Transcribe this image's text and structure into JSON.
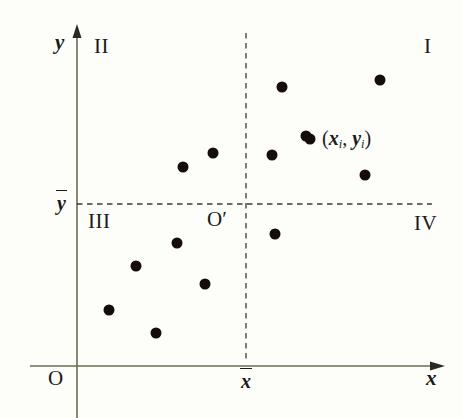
{
  "figure": {
    "background_color": "#fdfdfa",
    "axis_color": "#6b6b52",
    "dash_color": "#3a3a3a",
    "point_color": "#140d0a",
    "text_color": "#1a1a1a"
  },
  "axes": {
    "x_label": "x",
    "y_label": "y",
    "origin_label": "O",
    "x_axis_y": 366,
    "y_axis_x": 77,
    "x_axis_end": 443,
    "y_axis_top": 28
  },
  "means": {
    "x_mean_label": "x",
    "y_mean_label": "y",
    "x_mean_pixel": 246,
    "y_mean_pixel": 204,
    "new_origin_label": "O",
    "new_origin_prime": "′"
  },
  "quadrants": [
    {
      "name": "quadrant-one",
      "label": "I",
      "x": 424,
      "y": 36
    },
    {
      "name": "quadrant-two",
      "label": "II",
      "x": 94,
      "y": 36
    },
    {
      "name": "quadrant-three",
      "label": "III",
      "x": 88,
      "y": 211
    },
    {
      "name": "quadrant-four",
      "label": "IV",
      "x": 414,
      "y": 213
    }
  ],
  "annotation": {
    "text": "(x_i, y_i)",
    "open_paren": "(",
    "x_var": "x",
    "x_sub": "i",
    "comma": ", ",
    "y_var": "y",
    "y_sub": "i",
    "close_paren": ")",
    "x": 322,
    "y": 128
  },
  "chart_data": {
    "type": "scatter",
    "title": "",
    "xlabel": "x",
    "ylabel": "y",
    "grid": false,
    "legend": null,
    "reference_lines": [
      {
        "name": "x-mean-vertical",
        "orientation": "vertical",
        "value_label": "x̄",
        "pixel": 246,
        "style": "dashed"
      },
      {
        "name": "y-mean-horizontal",
        "orientation": "horizontal",
        "value_label": "ȳ",
        "pixel": 204,
        "style": "dashed"
      }
    ],
    "point_radius": 5.5,
    "points": [
      {
        "px": 282,
        "py": 87,
        "quadrant": "I"
      },
      {
        "px": 380,
        "py": 80,
        "quadrant": "I"
      },
      {
        "px": 310,
        "py": 139,
        "quadrant": "I"
      },
      {
        "px": 272,
        "py": 155,
        "quadrant": "I"
      },
      {
        "px": 365,
        "py": 175,
        "quadrant": "I"
      },
      {
        "px": 213,
        "py": 153,
        "quadrant": "II"
      },
      {
        "px": 183,
        "py": 167,
        "quadrant": "II"
      },
      {
        "px": 177,
        "py": 243,
        "quadrant": "III"
      },
      {
        "px": 136,
        "py": 266,
        "quadrant": "III"
      },
      {
        "px": 205,
        "py": 284,
        "quadrant": "III"
      },
      {
        "px": 109,
        "py": 310,
        "quadrant": "III"
      },
      {
        "px": 156,
        "py": 333,
        "quadrant": "III"
      },
      {
        "px": 275,
        "py": 234,
        "quadrant": "IV"
      }
    ],
    "annotated_point": {
      "px": 306,
      "py": 136,
      "label": "(x_i, y_i)"
    },
    "n_points": 13
  }
}
